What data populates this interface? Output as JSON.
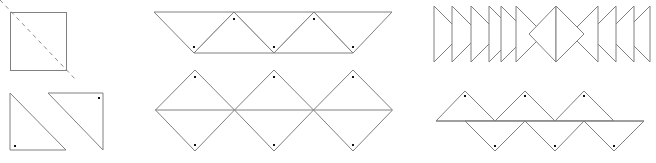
{
  "diagram": {
    "colors": {
      "stroke": "#808080",
      "dot": "#111111",
      "background": "#ffffff"
    },
    "square_cut": {
      "square": {
        "x": 10,
        "y": 12,
        "w": 56,
        "h": 58
      },
      "cut_line": {
        "x1": 0,
        "y1": 0,
        "x2": 77,
        "y2": 81
      }
    },
    "half_triangles": [
      {
        "points": "10,93 10,150 66,150",
        "dot": [
          15,
          146
        ]
      },
      {
        "points": "48,93 103,93 103,150",
        "dot": [
          99,
          98
        ]
      }
    ],
    "top_strip": {
      "triangles": [
        {
          "points": "154,12 234,12 194,53",
          "dot": [
            194,
            47
          ]
        },
        {
          "points": "234,12 274,53 194,53",
          "dot": [
            234,
            19
          ]
        },
        {
          "points": "234,12 314,12 274,53",
          "dot": [
            274,
            47
          ]
        },
        {
          "points": "314,12 353,53 274,53",
          "dot": [
            314,
            19
          ]
        },
        {
          "points": "314,12 392,12 353,53",
          "dot": [
            353,
            47
          ]
        }
      ]
    },
    "diamond_row": {
      "diamonds": [
        {
          "cx": 195,
          "dots": [
            [
              195,
              77
            ],
            [
              195,
              145
            ]
          ]
        },
        {
          "cx": 274,
          "dots": [
            [
              274,
              77
            ],
            [
              274,
              145
            ]
          ]
        },
        {
          "cx": 353,
          "dots": [
            [
              353,
              77
            ],
            [
              353,
              145
            ]
          ]
        }
      ],
      "half_width": 39.5,
      "top": 70,
      "mid": 110,
      "bottom": 151,
      "centerline": {
        "x1": 155,
        "x2": 392,
        "y": 110
      }
    },
    "arrow_row": {
      "right_pointing": [
        {
          "points": "434,6 462,34 434,62"
        },
        {
          "points": "452,6 480,34 452,62"
        },
        {
          "points": "471,6 499,34 471,62"
        },
        {
          "points": "489,6 517,34 489,62"
        },
        {
          "points": "501,6 529,34 501,62"
        },
        {
          "points": "516,6 544,34 516,62"
        }
      ],
      "center_diamond": [
        {
          "points": "556,6 529,34 556,62"
        },
        {
          "points": "556,6 584,34 556,62"
        }
      ],
      "left_pointing": [
        {
          "points": "598,6 570,34 598,62"
        },
        {
          "points": "616,6 588,34 616,62"
        },
        {
          "points": "634,6 606,34 634,62"
        },
        {
          "points": "650,6 622,34 650,62"
        }
      ]
    },
    "zigzag_row": {
      "baseline": {
        "x1": 436,
        "x2": 644,
        "y": 121
      },
      "up_triangles": [
        {
          "points": "436,121 465,91 495,121",
          "dot": [
            465,
            96
          ]
        },
        {
          "points": "495,121 525,91 555,121",
          "dot": [
            525,
            96
          ]
        },
        {
          "points": "555,121 584,91 614,121",
          "dot": [
            584,
            96
          ]
        }
      ],
      "down_triangles": [
        {
          "points": "465,121 495,151 525,121",
          "dot": [
            495,
            146
          ]
        },
        {
          "points": "525,121 555,151 584,121",
          "dot": [
            555,
            146
          ]
        },
        {
          "points": "584,121 614,151 644,121",
          "dot": [
            614,
            146
          ]
        }
      ]
    }
  }
}
